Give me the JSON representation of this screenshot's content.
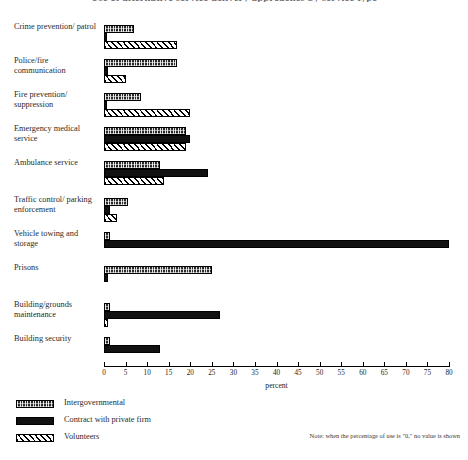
{
  "chart_data": {
    "type": "bar",
    "orientation": "horizontal",
    "title": "Use of alternative service delivery approaches by service type",
    "xlabel": "percent",
    "ylabel": "",
    "xlim": [
      0,
      80
    ],
    "xticks": [
      0,
      5,
      10,
      15,
      20,
      25,
      30,
      35,
      40,
      45,
      50,
      55,
      60,
      65,
      70,
      75,
      80
    ],
    "xtick_labels": [
      "0",
      "5",
      "10",
      "15",
      "20",
      "25",
      "30",
      "35",
      "40",
      "45",
      "50",
      "55",
      "60",
      "65",
      "70",
      "75",
      "80"
    ],
    "grid": false,
    "legend_position": "bottom-left",
    "note": "Note: when the percentage of use is \"0,\" no value is shown",
    "categories": [
      "Crime prevention/ patrol",
      "Police/fire communication",
      "Fire prevention/ suppression",
      "Emergency medical service",
      "Ambulance service",
      "Traffic control/ parking enforcement",
      "Vehicle towing and storage",
      "Prisons",
      "Building/grounds maintenance",
      "Building security"
    ],
    "series": [
      {
        "name": "Intergovernmental",
        "pattern": "stipple",
        "values": [
          7.0,
          17.0,
          8.5,
          19.0,
          13.0,
          5.5,
          1.5,
          25.0,
          1.5,
          1.5
        ]
      },
      {
        "name": "Contract with private firm",
        "pattern": "solid-black",
        "values": [
          0.5,
          1.0,
          0.5,
          20.0,
          24.0,
          1.5,
          80.0,
          1.0,
          27.0,
          13.0
        ]
      },
      {
        "name": "Volunteers",
        "pattern": "diagonal-hatch",
        "values": [
          17.0,
          5.0,
          20.0,
          19.0,
          14.0,
          3.0,
          0.0,
          0.0,
          1.0,
          0.0
        ]
      }
    ]
  },
  "axis": {
    "title": "percent"
  },
  "legend": {
    "items": [
      {
        "label": "Intergovernmental"
      },
      {
        "label": "Contract with private firm"
      },
      {
        "label": "Volunteers"
      }
    ]
  },
  "footnote": {
    "text": "Note: when the percentage of use is \"0,\" no value is shown"
  },
  "colors": {
    "ink": "#111111",
    "paper": "#ffffff",
    "label": "#2b2b2b"
  }
}
